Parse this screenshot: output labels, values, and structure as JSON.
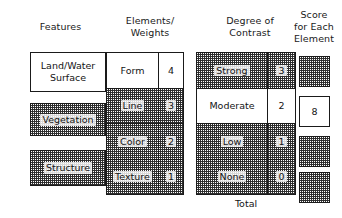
{
  "columns": {
    "features_header": "Features",
    "elements_header": "Elements/\nWeights",
    "contrast_header": "Degree of\nContrast",
    "score_header": "Score\nfor Each\nElement"
  },
  "features": [
    {
      "label": "Land/Water\nSurface",
      "fill": "white"
    },
    {
      "label": "Vegetation",
      "fill": "shaded"
    },
    {
      "label": "Structure",
      "fill": "shaded"
    }
  ],
  "elements": [
    {
      "label": "Form",
      "weight": "4",
      "fill": "white"
    },
    {
      "label": "Line",
      "weight": "3",
      "fill": "shaded"
    },
    {
      "label": "Color",
      "weight": "2",
      "fill": "shaded"
    },
    {
      "label": "Texture",
      "weight": "1",
      "fill": "shaded"
    }
  ],
  "contrast": [
    {
      "label": "Strong",
      "value": "3",
      "fill": "shaded"
    },
    {
      "label": "Moderate",
      "value": "2",
      "fill": "white"
    },
    {
      "label": "Low",
      "value": "1",
      "fill": "shaded"
    },
    {
      "label": "None",
      "value": "0",
      "fill": "shaded"
    }
  ],
  "scores": [
    {
      "value": "",
      "fill": "shaded"
    },
    {
      "value": "8",
      "fill": "white"
    },
    {
      "value": "",
      "fill": "shaded"
    },
    {
      "value": "",
      "fill": "shaded"
    }
  ],
  "total_label": "Total",
  "colors": {
    "ink": "#1a1a1a",
    "paper": "#ffffff"
  }
}
